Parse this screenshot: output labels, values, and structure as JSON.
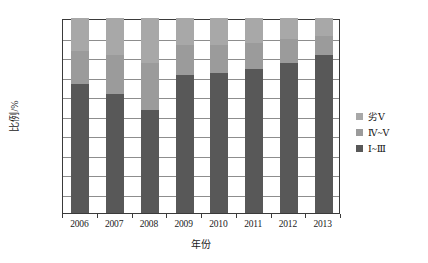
{
  "chart_data": {
    "type": "bar",
    "subtype": "stacked-percentage",
    "title": "",
    "xlabel": "年份",
    "ylabel": "比例/%",
    "ylim": [
      0,
      100
    ],
    "ytick_step": 10,
    "yticks": [
      0,
      10,
      20,
      30,
      40,
      50,
      60,
      70,
      80,
      90,
      100
    ],
    "ytick_labels": [
      "0",
      "10",
      "20",
      "30",
      "40",
      "50",
      "60",
      "70",
      "80",
      "90",
      "100"
    ],
    "categories": [
      "2006",
      "2007",
      "2008",
      "2009",
      "2010",
      "2011",
      "2012",
      "2013"
    ],
    "grid": true,
    "grid_axis": "y",
    "legend_position": "right",
    "series": [
      {
        "name": "Ⅰ~Ⅲ",
        "color": "#585858",
        "values": [
          66,
          61,
          53,
          71,
          72,
          74,
          77,
          81
        ]
      },
      {
        "name": "Ⅳ~Ⅴ",
        "color": "#9b9b9b",
        "values": [
          17,
          20,
          24,
          15,
          14,
          13,
          12,
          10
        ]
      },
      {
        "name": "劣Ⅴ",
        "color": "#a8a8a8",
        "values": [
          17,
          19,
          23,
          14,
          14,
          13,
          11,
          9
        ]
      }
    ]
  },
  "legend": {
    "items": [
      {
        "label": "劣Ⅴ",
        "color": "#a8a8a8"
      },
      {
        "label": "Ⅳ~Ⅴ",
        "color": "#9b9b9b"
      },
      {
        "label": "Ⅰ~Ⅲ",
        "color": "#585858"
      }
    ]
  },
  "axes": {
    "y_title": "比例/%",
    "x_title": "年份"
  }
}
